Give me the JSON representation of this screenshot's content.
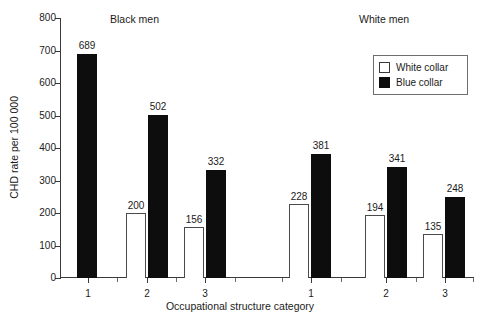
{
  "chart_data": {
    "type": "bar",
    "title": "",
    "xlabel": "Occupational structure category",
    "ylabel": "CHD rate per 100 000",
    "ylim": [
      0,
      800
    ],
    "yticks": [
      0,
      100,
      200,
      300,
      400,
      500,
      600,
      700,
      800
    ],
    "ytick_labels": [
      "0",
      "100",
      "200",
      "300",
      "400",
      "500",
      "600",
      "700",
      "800"
    ],
    "grid": false,
    "legend_position": "top-right",
    "legend": [
      "White collar",
      "Blue collar"
    ],
    "panels": [
      {
        "title": "Black men",
        "categories": [
          "1",
          "2",
          "3"
        ],
        "series": [
          {
            "name": "White collar",
            "values": [
              null,
              200,
              156
            ]
          },
          {
            "name": "Blue collar",
            "values": [
              689,
              502,
              332
            ]
          }
        ]
      },
      {
        "title": "White men",
        "categories": [
          "1",
          "2",
          "3"
        ],
        "series": [
          {
            "name": "White collar",
            "values": [
              228,
              194,
              135
            ]
          },
          {
            "name": "Blue collar",
            "values": [
              381,
              341,
              248
            ]
          }
        ]
      }
    ],
    "bar_colors": {
      "White collar": "#ffffff",
      "Blue collar": "#0d0d0d"
    },
    "annotations": [
      "689",
      "200",
      "502",
      "156",
      "332",
      "228",
      "381",
      "194",
      "341",
      "135",
      "248"
    ]
  },
  "axes": {
    "y_title": "CHD rate per 100 000",
    "x_title": "Occupational structure category",
    "y_ticks": [
      {
        "label": "800",
        "value": 800
      },
      {
        "label": "700",
        "value": 700
      },
      {
        "label": "600",
        "value": 600
      },
      {
        "label": "500",
        "value": 500
      },
      {
        "label": "400",
        "value": 400
      },
      {
        "label": "300",
        "value": 300
      },
      {
        "label": "200",
        "value": 200
      },
      {
        "label": "100",
        "value": 100
      },
      {
        "label": "0",
        "value": 0
      }
    ]
  },
  "panel_titles": {
    "black_men": "Black men",
    "white_men": "White men"
  },
  "legend": {
    "items": [
      {
        "label": "White collar",
        "swatch": "white-collar-swatch"
      },
      {
        "label": "Blue collar",
        "swatch": "blue-collar-swatch"
      }
    ]
  },
  "x_tick_labels": {
    "black": [
      "1",
      "2",
      "3"
    ],
    "white": [
      "1",
      "2",
      "3"
    ]
  },
  "bars": [
    {
      "id": "black-1-blue",
      "panel": "Black men",
      "category": "1",
      "series": "Blue collar",
      "value": 689,
      "label": "689"
    },
    {
      "id": "black-2-white",
      "panel": "Black men",
      "category": "2",
      "series": "White collar",
      "value": 200,
      "label": "200"
    },
    {
      "id": "black-2-blue",
      "panel": "Black men",
      "category": "2",
      "series": "Blue collar",
      "value": 502,
      "label": "502"
    },
    {
      "id": "black-3-white",
      "panel": "Black men",
      "category": "3",
      "series": "White collar",
      "value": 156,
      "label": "156"
    },
    {
      "id": "black-3-blue",
      "panel": "Black men",
      "category": "3",
      "series": "Blue collar",
      "value": 332,
      "label": "332"
    },
    {
      "id": "white-1-white",
      "panel": "White men",
      "category": "1",
      "series": "White collar",
      "value": 228,
      "label": "228"
    },
    {
      "id": "white-1-blue",
      "panel": "White men",
      "category": "1",
      "series": "Blue collar",
      "value": 381,
      "label": "381"
    },
    {
      "id": "white-2-white",
      "panel": "White men",
      "category": "2",
      "series": "White collar",
      "value": 194,
      "label": "194"
    },
    {
      "id": "white-2-blue",
      "panel": "White men",
      "category": "2",
      "series": "Blue collar",
      "value": 341,
      "label": "341"
    },
    {
      "id": "white-3-white",
      "panel": "White men",
      "category": "3",
      "series": "White collar",
      "value": 135,
      "label": "135"
    },
    {
      "id": "white-3-blue",
      "panel": "White men",
      "category": "3",
      "series": "Blue collar",
      "value": 248,
      "label": "248"
    }
  ]
}
